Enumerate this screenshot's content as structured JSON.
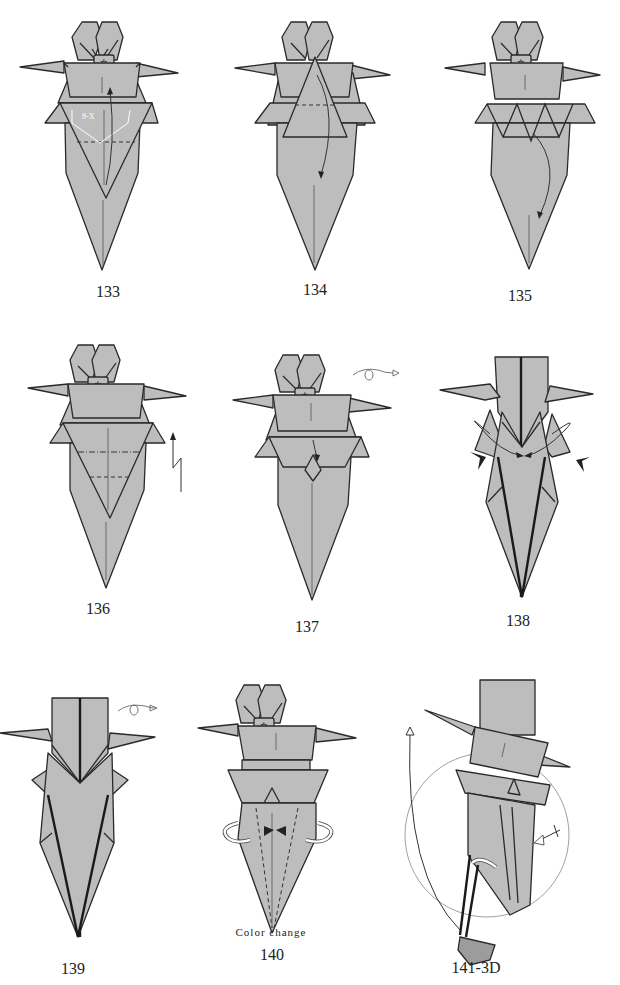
{
  "page": {
    "background": "#ffffff",
    "paper_fill": "#bdbdbd",
    "outline": "#2a2a2a"
  },
  "steps": [
    {
      "number": "133",
      "note": "",
      "label_x": 100,
      "label_y": 283,
      "x": 20,
      "y": 15,
      "variant": "base",
      "symbols": [
        "valley-fold-line",
        "fold-up-arrow",
        "angle-bisector-marks"
      ],
      "angle_mark": "8-X"
    },
    {
      "number": "134",
      "note": "",
      "label_x": 300,
      "label_y": 281,
      "x": 235,
      "y": 15,
      "variant": "triangle-up",
      "symbols": [
        "valley-fold-line",
        "fold-down-arrow"
      ]
    },
    {
      "number": "135",
      "note": "",
      "label_x": 510,
      "label_y": 287,
      "x": 445,
      "y": 15,
      "variant": "zigzag",
      "symbols": [
        "fold-down-arrow"
      ]
    },
    {
      "number": "136",
      "note": "",
      "label_x": 96,
      "label_y": 600,
      "x": 28,
      "y": 340,
      "variant": "base",
      "symbols": [
        "mountain-fold-line",
        "valley-fold-line",
        "pleat-arrow"
      ]
    },
    {
      "number": "137",
      "note": "",
      "label_x": 307,
      "label_y": 618,
      "x": 233,
      "y": 355,
      "variant": "collar",
      "symbols": [
        "turn-over-icon",
        "fold-arrow"
      ]
    },
    {
      "number": "138",
      "note": "",
      "label_x": 514,
      "label_y": 612,
      "x": 440,
      "y": 352,
      "variant": "narrow",
      "symbols": [
        "squash-arrows",
        "push-arrows"
      ]
    },
    {
      "number": "139",
      "note": "",
      "label_x": 73,
      "label_y": 960,
      "x": 0,
      "y": 693,
      "variant": "narrow-wings",
      "symbols": [
        "turn-over-icon"
      ]
    },
    {
      "number": "140",
      "note": "Color change",
      "label_x": 270,
      "label_y": 948,
      "x": 198,
      "y": 678,
      "variant": "color-change",
      "symbols": [
        "valley-fold-line",
        "rotate-arrows",
        "push-arrows"
      ]
    },
    {
      "number": "141-3D",
      "note": "",
      "label_x": 470,
      "label_y": 960,
      "x": 400,
      "y": 675,
      "variant": "3d",
      "symbols": [
        "zoom-circle",
        "push-arrow",
        "rotate-arrow",
        "fold-arrow"
      ]
    }
  ]
}
